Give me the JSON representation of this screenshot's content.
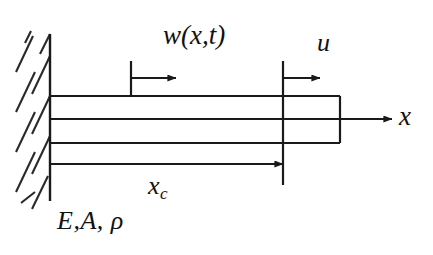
{
  "figure": {
    "background_color": "#ffffff",
    "line_color": "#1a1a1a",
    "labels": {
      "transverse_displacement": "w(x,t)",
      "axial_displacement": "u",
      "axis_x": "x",
      "crack_position_base": "x",
      "crack_position_subscript": "c",
      "material_properties": "E,A, ρ"
    },
    "geometry": {
      "wall_x": 50,
      "wall_top_y": 34,
      "wall_bottom_y": 201,
      "rod_left_x": 50,
      "rod_right_x": 340,
      "rod_top_y": 96,
      "rod_mid_upper_y": 119,
      "rod_bottom_y": 143,
      "xc_line_y": 164,
      "xc_marker_x": 283,
      "w_tick_x": 131,
      "u_tick_x": 283,
      "arrow_row_y": 78,
      "axis_arrow_y": 119,
      "axis_arrow_end_x": 392
    }
  }
}
